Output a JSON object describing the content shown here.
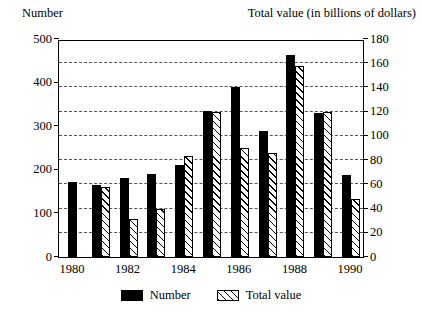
{
  "chart_data": {
    "type": "bar",
    "title": "",
    "grid": true,
    "legend_position": "bottom",
    "left_axis": {
      "label": "Number",
      "ylim": [
        0,
        500
      ],
      "ticks": [
        0,
        100,
        200,
        300,
        400,
        500
      ],
      "tick_labels": [
        "0",
        "100",
        "200",
        "300",
        "400",
        "500"
      ]
    },
    "right_axis": {
      "label": "Total value (in billions of dollars)",
      "ylim": [
        0,
        180
      ],
      "ticks": [
        0,
        20,
        40,
        60,
        80,
        100,
        120,
        140,
        160,
        180
      ],
      "tick_labels": [
        "0",
        "20",
        "40",
        "60",
        "80",
        "100",
        "120",
        "140",
        "160",
        "180"
      ]
    },
    "xlabel": "",
    "categories": [
      1980,
      1981,
      1982,
      1983,
      1984,
      1985,
      1986,
      1987,
      1988,
      1989,
      1990
    ],
    "tick_labels": [
      "1980",
      "",
      "1982",
      "",
      "1984",
      "",
      "1986",
      "",
      "1988",
      "",
      "1990"
    ],
    "series": [
      {
        "name": "Number",
        "axis": "left",
        "style": "solid-black",
        "values": [
          172,
          166,
          181,
          191,
          211,
          334,
          390,
          290,
          463,
          331,
          189
        ]
      },
      {
        "name": "Total value",
        "axis": "right",
        "style": "hatched",
        "values": [
          null,
          58,
          31,
          40,
          83,
          120,
          90,
          86,
          158,
          120,
          48
        ]
      }
    ],
    "legend": [
      "Number",
      "Total value"
    ]
  },
  "legend": {
    "number_label": "Number",
    "value_label": "Total value"
  },
  "colors": {
    "number_bar": "#000000",
    "value_bar_outline": "#000000",
    "grid": "#555555",
    "frame": "#000000"
  }
}
